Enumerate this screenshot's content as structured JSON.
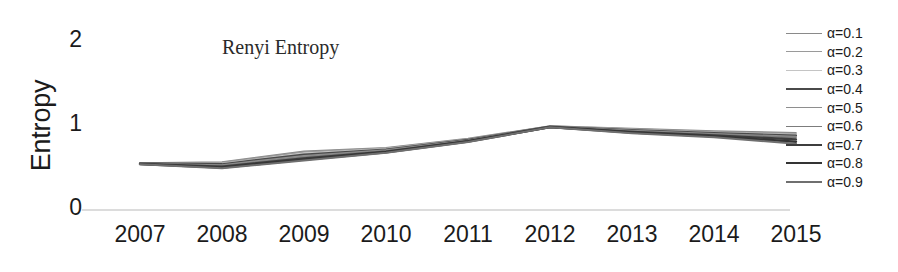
{
  "chart_data": {
    "type": "line",
    "title": "Renyi Entropy",
    "xlabel": "",
    "ylabel": "Entropy",
    "categories": [
      "2007",
      "2008",
      "2009",
      "2010",
      "2011",
      "2012",
      "2013",
      "2014",
      "2015"
    ],
    "x": [
      2007,
      2008,
      2009,
      2010,
      2011,
      2012,
      2013,
      2014,
      2015
    ],
    "ylim": [
      0,
      2
    ],
    "y_ticks": [
      0,
      1,
      2
    ],
    "grid": false,
    "legend_position": "right",
    "series": [
      {
        "name": "α=0.1",
        "color": "#8a8a8a",
        "width": 1.6,
        "values": [
          0.56,
          0.57,
          0.7,
          0.74,
          0.85,
          1.0,
          0.97,
          0.94,
          0.92
        ]
      },
      {
        "name": "α=0.2",
        "color": "#9a9a9a",
        "width": 1.6,
        "values": [
          0.56,
          0.565,
          0.69,
          0.735,
          0.845,
          0.998,
          0.965,
          0.932,
          0.908
        ]
      },
      {
        "name": "α=0.3",
        "color": "#c4c4c4",
        "width": 1.5,
        "values": [
          0.555,
          0.555,
          0.675,
          0.728,
          0.84,
          0.996,
          0.958,
          0.924,
          0.898
        ]
      },
      {
        "name": "α=0.4",
        "color": "#4a4a4a",
        "width": 2.2,
        "values": [
          0.555,
          0.545,
          0.66,
          0.72,
          0.835,
          0.994,
          0.951,
          0.915,
          0.886
        ]
      },
      {
        "name": "α=0.5",
        "color": "#8e8e8e",
        "width": 1.7,
        "values": [
          0.552,
          0.535,
          0.645,
          0.712,
          0.83,
          0.992,
          0.944,
          0.906,
          0.874
        ]
      },
      {
        "name": "α=0.6",
        "color": "#7c7c7c",
        "width": 1.7,
        "values": [
          0.55,
          0.525,
          0.63,
          0.704,
          0.825,
          0.99,
          0.937,
          0.897,
          0.862
        ]
      },
      {
        "name": "α=0.7",
        "color": "#3d3d3d",
        "width": 2.3,
        "values": [
          0.548,
          0.515,
          0.615,
          0.696,
          0.82,
          0.988,
          0.93,
          0.888,
          0.84
        ]
      },
      {
        "name": "α=0.8",
        "color": "#343434",
        "width": 2.4,
        "values": [
          0.546,
          0.505,
          0.6,
          0.688,
          0.815,
          0.986,
          0.922,
          0.876,
          0.812
        ]
      },
      {
        "name": "α=0.9",
        "color": "#6f6f6f",
        "width": 2.0,
        "values": [
          0.544,
          0.498,
          0.59,
          0.682,
          0.81,
          0.984,
          0.915,
          0.866,
          0.788
        ]
      }
    ]
  },
  "axis": {
    "baseline_color": "#d0d0d0"
  }
}
